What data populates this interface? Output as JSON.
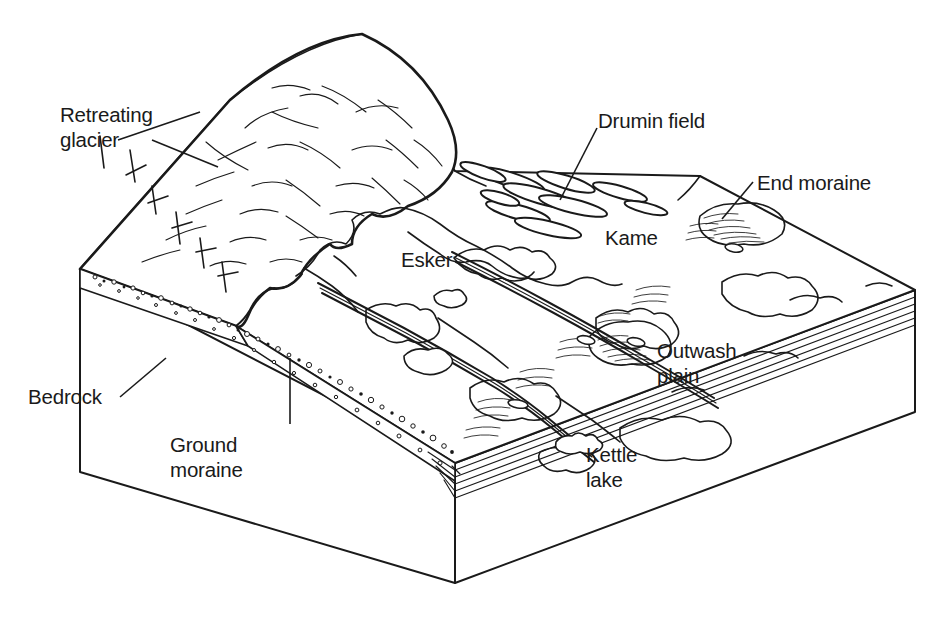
{
  "figure": {
    "type": "geological-block-diagram",
    "background_color": "#ffffff",
    "ink_color": "#1a1a1a"
  },
  "labels": {
    "retreating_glacier_line1": "Retreating",
    "retreating_glacier_line2": "glacier",
    "drumlin_field": "Drumin field",
    "end_moraine": "End moraine",
    "kame": "Kame",
    "esker": "Esker",
    "outwash_plain_line1": "Outwash",
    "outwash_plain_line2": "plain",
    "kettle_lake_line1": "Kettle",
    "kettle_lake_line2": "lake",
    "bedrock": "Bedrock",
    "ground_moraine_line1": "Ground",
    "ground_moraine_line2": "moraine"
  },
  "features": [
    {
      "name": "retreating-glacier",
      "description": "Ice mass with crevasses occupying upper-left of block"
    },
    {
      "name": "drumlin-field",
      "description": "Swarm of elongate teardrop hills aligned with ice flow"
    },
    {
      "name": "end-moraine",
      "description": "Ridge of till at former ice margin, right side"
    },
    {
      "name": "kame",
      "description": "Mound of stratified drift on outwash surface"
    },
    {
      "name": "esker",
      "description": "Sinuous ridge of sand and gravel crossing the plain"
    },
    {
      "name": "outwash-plain",
      "description": "Braided meltwater sediment plain beyond the moraine"
    },
    {
      "name": "kettle-lake",
      "description": "Depression lake formed by melted buried ice block"
    },
    {
      "name": "ground-moraine",
      "description": "Stippled till layer beneath the glacier"
    },
    {
      "name": "bedrock",
      "description": "Solid rock foundation forming the lower block"
    }
  ]
}
